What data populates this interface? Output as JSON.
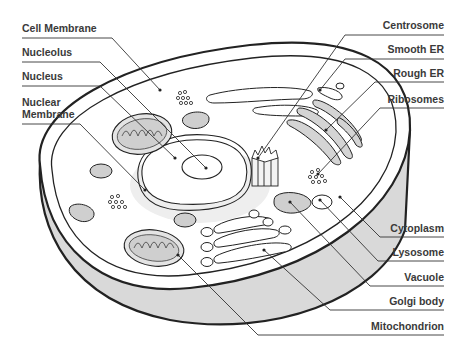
{
  "diagram": {
    "labels_left": [
      {
        "id": "cell-membrane",
        "text": "Cell Membrane",
        "x": 22,
        "y": 20
      },
      {
        "id": "nucleolus",
        "text": "Nucleolus",
        "x": 22,
        "y": 45
      },
      {
        "id": "nucleus",
        "text": "Nucleus",
        "x": 22,
        "y": 69
      },
      {
        "id": "nuclear-membrane-1",
        "text": "Nuclear",
        "x": 22,
        "y": 94
      },
      {
        "id": "nuclear-membrane-2",
        "text": "Membrane",
        "x": 22,
        "y": 106
      }
    ],
    "labels_right": [
      {
        "id": "centrosome",
        "text": "Centrosome",
        "right": 21,
        "y": 17
      },
      {
        "id": "smooth-er",
        "text": "Smooth ER",
        "right": 21,
        "y": 41
      },
      {
        "id": "rough-er",
        "text": "Rough ER",
        "right": 21,
        "y": 66
      },
      {
        "id": "ribosomes",
        "text": "Ribosomes",
        "right": 21,
        "y": 92
      },
      {
        "id": "cytoplasm",
        "text": "Cytoplasm",
        "right": 21,
        "y": 222
      },
      {
        "id": "lysosome",
        "text": "Lysosome",
        "right": 21,
        "y": 246
      },
      {
        "id": "vacuole",
        "text": "Vacuole",
        "right": 21,
        "y": 271
      },
      {
        "id": "golgi-body",
        "text": "Golgi body",
        "right": 21,
        "y": 295
      },
      {
        "id": "mitochondrion",
        "text": "Mitochondrion",
        "right": 21,
        "y": 320
      }
    ],
    "colors": {
      "outline": "#222222",
      "organelle_fill": "#cfcfcf",
      "side_fill": "#d9d9d9",
      "label_text": "#3a3a3a"
    }
  }
}
